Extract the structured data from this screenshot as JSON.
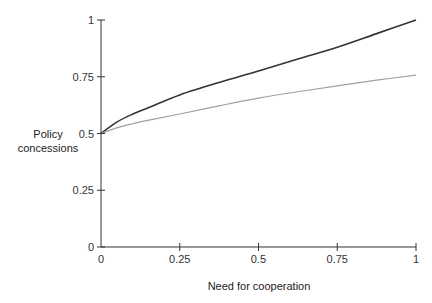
{
  "chart_data": {
    "type": "line",
    "title": "",
    "xlabel": "Need for cooperation",
    "ylabel": [
      "Policy",
      "concessions"
    ],
    "xlim": [
      0,
      1
    ],
    "ylim": [
      0,
      1
    ],
    "grid": false,
    "legend": "none",
    "x_ticks": [
      0,
      0.25,
      0.5,
      0.75,
      1
    ],
    "x_tick_labels": [
      "0",
      "0.25",
      "0.5",
      "0.75",
      "1"
    ],
    "y_ticks": [
      0,
      0.25,
      0.5,
      0.75,
      1
    ],
    "y_tick_labels": [
      "0",
      "0.25",
      "0.5",
      "0.75",
      "1"
    ],
    "series": [
      {
        "name": "upper curve",
        "color": "#333333",
        "x": [
          0,
          0.05,
          0.1,
          0.156,
          0.25,
          0.375,
          0.5,
          0.625,
          0.75,
          0.875,
          1
        ],
        "values": [
          0.5,
          0.55,
          0.585,
          0.617,
          0.67,
          0.725,
          0.775,
          0.828,
          0.88,
          0.94,
          1.0
        ]
      },
      {
        "name": "lower curve",
        "color": "#a0a0a0",
        "x": [
          0,
          0.05,
          0.1,
          0.156,
          0.25,
          0.375,
          0.5,
          0.625,
          0.75,
          0.875,
          1
        ],
        "values": [
          0.5,
          0.525,
          0.543,
          0.56,
          0.586,
          0.622,
          0.656,
          0.684,
          0.71,
          0.735,
          0.757
        ]
      }
    ]
  }
}
